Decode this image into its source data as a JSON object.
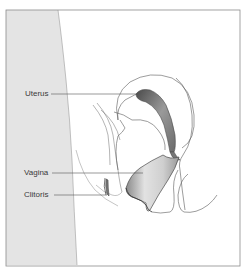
{
  "diagram": {
    "type": "anatomical-cross-section",
    "labels": [
      {
        "id": "uterus",
        "text": "Uterus"
      },
      {
        "id": "vagina",
        "text": "Vagina"
      },
      {
        "id": "clitoris",
        "text": "Clitoris"
      }
    ]
  },
  "colors": {
    "frame": "#8c8c8c",
    "body_fill": "#e6e6e6",
    "outline": "#5a5a5a",
    "organ_dark": "#6e6e6e",
    "organ_light": "#d8d8d8",
    "text": "#3a3a3a"
  }
}
